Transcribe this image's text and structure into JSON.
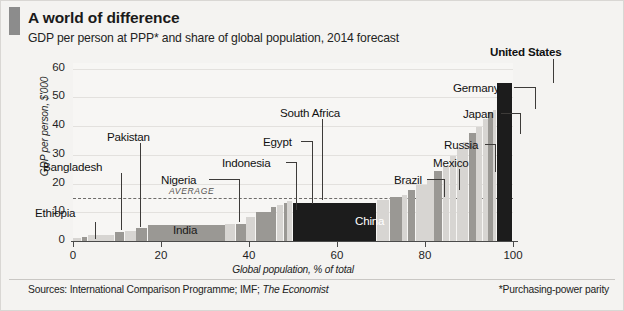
{
  "header": {
    "title": "A world of difference",
    "subtitle": "GDP per person at PPP* and share of global population, 2014 forecast",
    "accent_color": "#8c8c8c"
  },
  "footer": {
    "sources_prefix": "Sources: International Comparison Programme; IMF;",
    "sources_italic": "The Economist",
    "footnote": "*Purchasing-power parity"
  },
  "chart_data": {
    "type": "bar",
    "title": "A world of difference",
    "subtitle": "GDP per person at PPP* and share of global population, 2014 forecast",
    "xlabel": "Global population, % of total",
    "ylabel": "GDP per person, $'000",
    "xlim": [
      0,
      100
    ],
    "ylim": [
      0,
      62
    ],
    "xticks": [
      "0",
      "20",
      "40",
      "60",
      "80",
      "100"
    ],
    "xtick_values": [
      0,
      20,
      40,
      60,
      80,
      100
    ],
    "yticks": [
      "0",
      "10",
      "20",
      "30",
      "40",
      "50",
      "60"
    ],
    "ytick_values": [
      0,
      10,
      20,
      30,
      40,
      50,
      60
    ],
    "grid": true,
    "legend": "none",
    "note": "Marimekko-style: bar width = share of global population (%), bar height = GDP per person ($'000). Bars sorted ascending by GDP per person.",
    "average_line": {
      "label": "AVERAGE",
      "value": 15
    },
    "colors": {
      "plain_bar": "#d7d5d2",
      "highlight_bar": "#9a9894",
      "feature_bar": "#1c1c1c",
      "average_line": "#6e6c6a"
    },
    "bars": [
      {
        "name": "",
        "x_start": 0.0,
        "width": 2.0,
        "value": 1.2,
        "style": "plain",
        "label": ""
      },
      {
        "name": "Ethiopia",
        "x_start": 2.0,
        "width": 1.3,
        "value": 1.5,
        "style": "highlight",
        "label": "Ethiopia"
      },
      {
        "name": "",
        "x_start": 3.3,
        "width": 6.2,
        "value": 2.2,
        "style": "plain",
        "label": ""
      },
      {
        "name": "Bangladesh",
        "x_start": 9.5,
        "width": 2.3,
        "value": 3.1,
        "style": "highlight",
        "label": "Bangladesh"
      },
      {
        "name": "",
        "x_start": 11.8,
        "width": 2.6,
        "value": 3.6,
        "style": "plain",
        "label": ""
      },
      {
        "name": "Pakistan",
        "x_start": 14.4,
        "width": 2.6,
        "value": 4.6,
        "style": "highlight",
        "label": "Pakistan"
      },
      {
        "name": "India",
        "x_start": 17.0,
        "width": 17.6,
        "value": 5.5,
        "style": "highlight",
        "label": "India"
      },
      {
        "name": "",
        "x_start": 34.6,
        "width": 2.4,
        "value": 5.8,
        "style": "plain",
        "label": ""
      },
      {
        "name": "Nigeria",
        "x_start": 37.0,
        "width": 2.4,
        "value": 6.0,
        "style": "highlight",
        "label": "Nigeria"
      },
      {
        "name": "",
        "x_start": 39.4,
        "width": 2.2,
        "value": 8.4,
        "style": "plain",
        "label": ""
      },
      {
        "name": "Indonesia",
        "x_start": 41.6,
        "width": 3.5,
        "value": 10.2,
        "style": "highlight",
        "label": "Indonesia"
      },
      {
        "name": "Egypt",
        "x_start": 45.1,
        "width": 1.2,
        "value": 11.8,
        "style": "highlight",
        "label": "Egypt"
      },
      {
        "name": "",
        "x_start": 46.3,
        "width": 1.6,
        "value": 12.6,
        "style": "plain",
        "label": ""
      },
      {
        "name": "South Africa",
        "x_start": 47.9,
        "width": 0.8,
        "value": 13.4,
        "style": "highlight",
        "label": "South Africa"
      },
      {
        "name": "",
        "x_start": 48.7,
        "width": 1.3,
        "value": 14.0,
        "style": "plain",
        "label": ""
      },
      {
        "name": "China",
        "x_start": 50.0,
        "width": 19.0,
        "value": 13.2,
        "style": "feature",
        "label": "China"
      },
      {
        "name": "",
        "x_start": 69.0,
        "width": 3.0,
        "value": 14.4,
        "style": "plain",
        "label": ""
      },
      {
        "name": "Brazil",
        "x_start": 72.0,
        "width": 2.8,
        "value": 15.4,
        "style": "highlight",
        "label": "Brazil"
      },
      {
        "name": "",
        "x_start": 74.8,
        "width": 1.3,
        "value": 16.0,
        "style": "plain",
        "label": ""
      },
      {
        "name": "Mexico",
        "x_start": 76.1,
        "width": 1.8,
        "value": 17.6,
        "style": "highlight",
        "label": "Mexico"
      },
      {
        "name": "",
        "x_start": 77.9,
        "width": 2.6,
        "value": 19.4,
        "style": "plain",
        "label": ""
      },
      {
        "name": "",
        "x_start": 80.5,
        "width": 1.6,
        "value": 21.6,
        "style": "plain",
        "label": ""
      },
      {
        "name": "Russia",
        "x_start": 82.1,
        "width": 2.0,
        "value": 24.4,
        "style": "highlight",
        "label": "Russia"
      },
      {
        "name": "",
        "x_start": 84.1,
        "width": 1.6,
        "value": 26.2,
        "style": "plain",
        "label": ""
      },
      {
        "name": "",
        "x_start": 85.7,
        "width": 1.5,
        "value": 29.6,
        "style": "plain",
        "label": ""
      },
      {
        "name": "",
        "x_start": 87.2,
        "width": 1.5,
        "value": 32.4,
        "style": "plain",
        "label": ""
      },
      {
        "name": "",
        "x_start": 88.7,
        "width": 1.2,
        "value": 34.6,
        "style": "plain",
        "label": ""
      },
      {
        "name": "Japan",
        "x_start": 89.9,
        "width": 1.8,
        "value": 37.6,
        "style": "highlight",
        "label": "Japan"
      },
      {
        "name": "",
        "x_start": 91.7,
        "width": 1.5,
        "value": 39.6,
        "style": "plain",
        "label": ""
      },
      {
        "name": "",
        "x_start": 93.2,
        "width": 1.2,
        "value": 42.4,
        "style": "plain",
        "label": ""
      },
      {
        "name": "Germany",
        "x_start": 94.4,
        "width": 1.1,
        "value": 44.8,
        "style": "highlight",
        "label": "Germany"
      },
      {
        "name": "",
        "x_start": 95.5,
        "width": 0.8,
        "value": 45.6,
        "style": "plain",
        "label": ""
      },
      {
        "name": "United States",
        "x_start": 96.3,
        "width": 3.7,
        "value": 55.0,
        "style": "feature",
        "label": "United States"
      }
    ],
    "callouts": [
      {
        "label": "Ethiopia",
        "bold": false,
        "text_x": 34,
        "text_y": 205,
        "leader": {
          "type": "vert",
          "x": 94,
          "y_top": 221,
          "y_bottom": 238
        }
      },
      {
        "label": "Bangladesh",
        "bold": false,
        "text_x": 42,
        "text_y": 159,
        "leader": {
          "type": "vert",
          "x": 120,
          "y_top": 172,
          "y_bottom": 229
        }
      },
      {
        "label": "Pakistan",
        "bold": false,
        "text_x": 106,
        "text_y": 129,
        "leader": {
          "type": "vert",
          "x": 139,
          "y_top": 142,
          "y_bottom": 226
        }
      },
      {
        "label": "India",
        "bold": false,
        "in_bar": true,
        "text_x": 172,
        "text_y": 222
      },
      {
        "label": "Nigeria",
        "bold": false,
        "text_x": 160,
        "text_y": 172,
        "leader": {
          "type": "horz",
          "x_left": 208,
          "x_right": 238,
          "y": 178,
          "drop_x": 238,
          "drop_y_bottom": 221
        }
      },
      {
        "label": "Indonesia",
        "bold": false,
        "text_x": 221,
        "text_y": 155,
        "leader": {
          "type": "horz",
          "x_left": 285,
          "x_right": 295,
          "y": 161,
          "drop_x": 295,
          "drop_y_bottom": 209
        }
      },
      {
        "label": "Egypt",
        "bold": false,
        "text_x": 262,
        "text_y": 134,
        "leader": {
          "type": "horz",
          "x_left": 300,
          "x_right": 311,
          "y": 140,
          "drop_x": 311,
          "drop_y_bottom": 203
        }
      },
      {
        "label": "South Africa",
        "bold": false,
        "text_x": 279,
        "text_y": 105,
        "leader": {
          "type": "vert",
          "x": 321,
          "y_top": 118,
          "y_bottom": 199
        }
      },
      {
        "label": "China",
        "bold": false,
        "in_bar": true,
        "text_x": 354,
        "text_y": 213
      },
      {
        "label": "Brazil",
        "bold": false,
        "text_x": 393,
        "text_y": 172,
        "leader": {
          "type": "horz",
          "x_left": 426,
          "x_right": 443,
          "y": 178,
          "drop_x": 443,
          "drop_y_bottom": 196
        }
      },
      {
        "label": "Mexico",
        "bold": false,
        "text_x": 432,
        "text_y": 155,
        "leader": {
          "type": "vert",
          "x": 458,
          "y_top": 168,
          "y_bottom": 189
        }
      },
      {
        "label": "Russia",
        "bold": false,
        "text_x": 443,
        "text_y": 137,
        "leader": {
          "type": "horz",
          "x_left": 484,
          "x_right": 494,
          "y": 143,
          "drop_x": 494,
          "drop_y_bottom": 171
        }
      },
      {
        "label": "Japan",
        "bold": false,
        "text_x": 462,
        "text_y": 106,
        "leader": {
          "type": "horz",
          "x_left": 500,
          "x_right": 519,
          "y": 112,
          "drop_x": 519,
          "drop_y_bottom": 133
        }
      },
      {
        "label": "Germany",
        "bold": false,
        "text_x": 452,
        "text_y": 80,
        "leader": {
          "type": "horz",
          "x_left": 513,
          "x_right": 534,
          "y": 86,
          "drop_x": 534,
          "drop_y_bottom": 108
        }
      },
      {
        "label": "United States",
        "bold": true,
        "text_x": 489,
        "text_y": 44,
        "leader": {
          "type": "vert",
          "x": 552,
          "y_top": 58,
          "y_bottom": 82
        }
      }
    ]
  }
}
